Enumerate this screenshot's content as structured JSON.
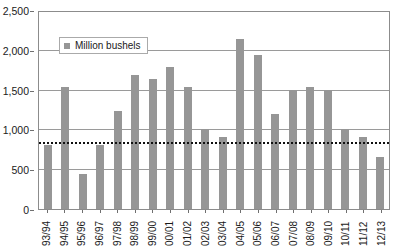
{
  "chart_data": {
    "type": "bar",
    "title": "",
    "xlabel": "",
    "ylabel": "",
    "ylim": [
      0,
      2500
    ],
    "yticks": [
      0,
      500,
      1000,
      1500,
      2000,
      2500
    ],
    "ytick_labels": [
      "0",
      "500",
      "1,000",
      "1,500",
      "2,000",
      "2,500"
    ],
    "grid": true,
    "legend": {
      "position": "inside-upper-left",
      "entries": [
        {
          "label": "Million bushels",
          "color": "#969696",
          "marker": "square"
        }
      ]
    },
    "categories": [
      "93/94",
      "94/95",
      "95/96",
      "96/97",
      "97/98",
      "98/99",
      "99/00",
      "00/01",
      "01/02",
      "02/03",
      "03/04",
      "04/05",
      "05/06",
      "06/07",
      "07/08",
      "08/09",
      "09/10",
      "10/11",
      "11/12",
      "12/13"
    ],
    "series": [
      {
        "name": "Million bushels",
        "color": "#969696",
        "values": [
          810,
          1545,
          450,
          810,
          1250,
          1705,
          1655,
          1805,
          1550,
          1010,
          910,
          2155,
          1960,
          1210,
          1510,
          1550,
          1510,
          1010,
          910,
          660
        ]
      }
    ],
    "annotations": [
      {
        "type": "reference-line",
        "orientation": "horizontal",
        "value": 830,
        "style": "dotted",
        "color": "#111111",
        "label": ""
      }
    ]
  },
  "colors": {
    "bar": "#969696",
    "gridline": "#9a9a9a",
    "axis": "#8c8c8c",
    "refline": "#111111",
    "text": "#1a1a1a",
    "background": "#ffffff"
  }
}
